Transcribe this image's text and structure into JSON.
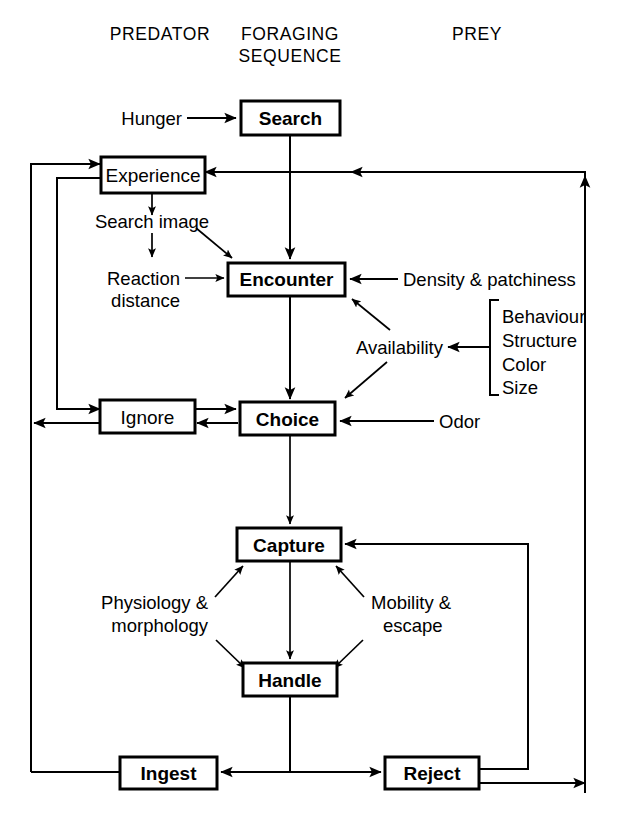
{
  "diagram": {
    "columns": [
      {
        "id": "predator",
        "label": "PREDATOR"
      },
      {
        "id": "foraging",
        "label_line1": "FORAGING",
        "label_line2": "SEQUENCE"
      },
      {
        "id": "prey",
        "label": "PREY"
      }
    ],
    "nodes": [
      {
        "id": "search",
        "label": "Search",
        "bold": true
      },
      {
        "id": "experience",
        "label": "Experience",
        "bold": false
      },
      {
        "id": "encounter",
        "label": "Encounter",
        "bold": true
      },
      {
        "id": "ignore",
        "label": "Ignore",
        "bold": false
      },
      {
        "id": "choice",
        "label": "Choice",
        "bold": true
      },
      {
        "id": "capture",
        "label": "Capture",
        "bold": true
      },
      {
        "id": "handle",
        "label": "Handle",
        "bold": true
      },
      {
        "id": "ingest",
        "label": "Ingest",
        "bold": true
      },
      {
        "id": "reject",
        "label": "Reject",
        "bold": true
      }
    ],
    "annotations": [
      {
        "id": "hunger",
        "label": "Hunger"
      },
      {
        "id": "search-image",
        "label": "Search image"
      },
      {
        "id": "reaction-distance-line1",
        "label": "Reaction"
      },
      {
        "id": "reaction-distance-line2",
        "label": "distance"
      },
      {
        "id": "density-patchiness",
        "label": "Density & patchiness"
      },
      {
        "id": "availability",
        "label": "Availability"
      },
      {
        "id": "odor",
        "label": "Odor"
      },
      {
        "id": "physiology-line1",
        "label": "Physiology &"
      },
      {
        "id": "physiology-line2",
        "label": "morphology"
      },
      {
        "id": "mobility-line1",
        "label": "Mobility &"
      },
      {
        "id": "mobility-line2",
        "label": "escape"
      }
    ],
    "prey_traits": {
      "bracket": "square-bracket",
      "items": [
        "Behaviour",
        "Structure",
        "Color",
        "Size"
      ]
    },
    "colors": {
      "stroke": "#000000",
      "background": "#ffffff",
      "text": "#000000"
    }
  }
}
